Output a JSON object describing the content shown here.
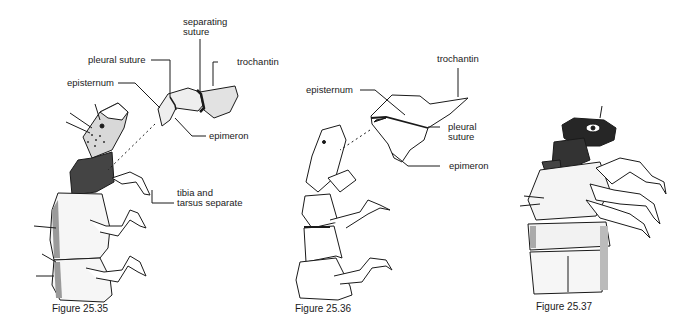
{
  "figures": [
    {
      "caption": "Figure 25.35",
      "labels": {
        "separating_suture_1": "separating",
        "separating_suture_2": "suture",
        "pleural_suture": "pleural suture",
        "trochantin": "trochantin",
        "episternum": "episternum",
        "epimeron": "epimeron",
        "tibia_1": "tibia and",
        "tibia_2": "tarsus separate"
      }
    },
    {
      "caption": "Figure 25.36",
      "labels": {
        "trochantin": "trochantin",
        "episternum": "episternum",
        "pleural_suture_1": "pleural",
        "pleural_suture_2": "suture",
        "epimeron": "epimeron"
      }
    },
    {
      "caption": "Figure 25.37",
      "labels": {}
    }
  ],
  "colors": {
    "ink": "#1a1a1a",
    "background": "#ffffff",
    "shade": "#555555"
  }
}
